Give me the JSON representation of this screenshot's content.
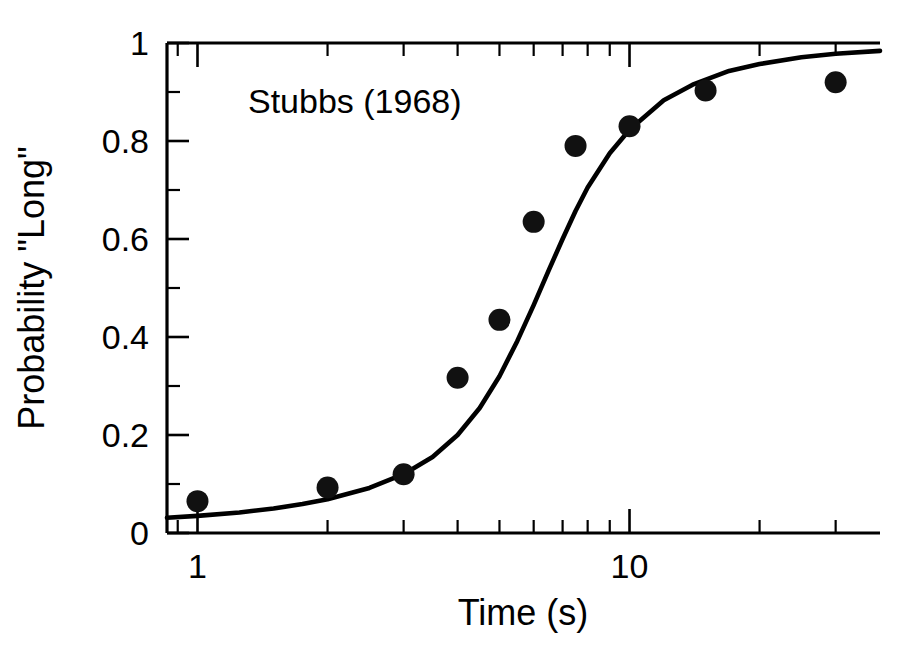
{
  "chart_data": {
    "type": "scatter",
    "title": "",
    "annotation": "Stubbs (1968)",
    "xlabel": "Time (s)",
    "ylabel": "Probability \"Long\"",
    "xscale": "log",
    "yscale": "linear",
    "xlim": [
      0.85,
      38
    ],
    "ylim": [
      0,
      1
    ],
    "grid": false,
    "legend": null,
    "x_tick_labels": [
      "1",
      "10"
    ],
    "x_tick_values": [
      1,
      10
    ],
    "x_minor_tick_values": [
      0.9,
      2,
      3,
      4,
      5,
      6,
      7,
      8,
      9,
      20,
      30
    ],
    "y_tick_labels": [
      "0",
      "0.2",
      "0.4",
      "0.6",
      "0.8",
      "1"
    ],
    "y_tick_values": [
      0,
      0.2,
      0.4,
      0.6,
      0.8,
      1
    ],
    "y_minor_tick_values": [
      0.1,
      0.3,
      0.5,
      0.7,
      0.9
    ],
    "series": [
      {
        "name": "Stubbs (1968) data",
        "marker": "filled-circle",
        "color": "#111111",
        "x": [
          1,
          2,
          3,
          4,
          5,
          6,
          7.5,
          10,
          15,
          30
        ],
        "y": [
          0.065,
          0.093,
          0.12,
          0.317,
          0.435,
          0.635,
          0.79,
          0.83,
          0.903,
          0.92
        ]
      },
      {
        "name": "Fitted function",
        "marker": "line",
        "color": "#000000",
        "x": [
          0.85,
          1,
          1.25,
          1.5,
          1.75,
          2,
          2.5,
          3,
          3.5,
          4,
          4.5,
          5,
          5.5,
          6,
          6.5,
          7,
          7.5,
          8,
          9,
          10,
          12,
          14,
          17,
          20,
          25,
          30,
          38
        ],
        "y": [
          0.031,
          0.035,
          0.042,
          0.05,
          0.059,
          0.069,
          0.092,
          0.12,
          0.155,
          0.2,
          0.255,
          0.32,
          0.392,
          0.465,
          0.536,
          0.6,
          0.657,
          0.705,
          0.775,
          0.823,
          0.883,
          0.915,
          0.943,
          0.957,
          0.971,
          0.978,
          0.984
        ]
      }
    ]
  },
  "axes": {
    "x_axis_name": "Time (s)",
    "y_axis_name": "Probability \"Long\""
  }
}
